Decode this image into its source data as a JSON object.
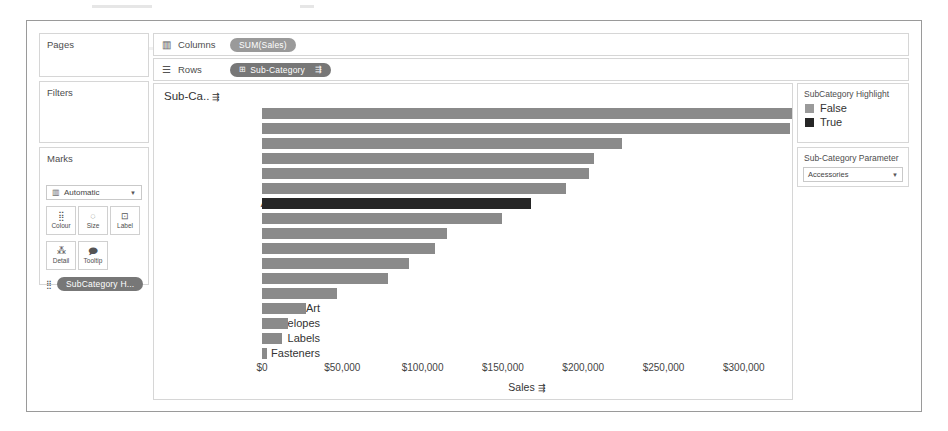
{
  "shelves": {
    "pages_label": "Pages",
    "filters_label": "Filters",
    "marks_label": "Marks",
    "columns_label": "Columns",
    "rows_label": "Rows",
    "columns_icon": "columns-icon",
    "rows_icon": "rows-icon",
    "columns_pill": "SUM(Sales)",
    "rows_pill": "Sub-Category",
    "rows_pill_icon": "discrete-field-icon",
    "rows_pill_sort": "sort-icon"
  },
  "marks": {
    "type_value": "Automatic",
    "type_icon": "bar-mark-icon",
    "buttons": [
      {
        "label": "Colour",
        "icon": "colour-icon"
      },
      {
        "label": "Size",
        "icon": "size-icon"
      },
      {
        "label": "Label",
        "icon": "label-icon"
      },
      {
        "label": "Detail",
        "icon": "detail-icon"
      },
      {
        "label": "Tooltip",
        "icon": "tooltip-icon"
      }
    ],
    "pill": "SubCategory H...",
    "pill_icon": "colour-icon"
  },
  "legend": {
    "title": "SubCategory Highlight",
    "items": [
      {
        "label": "False",
        "colour": "#9a9a9a"
      },
      {
        "label": "True",
        "colour": "#262626"
      }
    ]
  },
  "parameter": {
    "title": "Sub-Category Parameter",
    "value": "Accessories",
    "caret_icon": "chevron-down-icon"
  },
  "chart_data": {
    "type": "bar",
    "title": "",
    "orientation": "horizontal",
    "field_header": "Sub-Ca..",
    "field_header_sort_icon": "sort-icon",
    "xlabel": "Sales",
    "xlabel_sort_icon": "sort-icon",
    "ylabel": "",
    "xlim": [
      0,
      330000
    ],
    "ticks": [
      0,
      50000,
      100000,
      150000,
      200000,
      250000,
      300000
    ],
    "tick_labels": [
      "$0",
      "$50,000",
      "$100,000",
      "$150,000",
      "$200,000",
      "$250,000",
      "$300,000"
    ],
    "grid": false,
    "legend_position": "right",
    "highlight_category": "Accessories",
    "colours": {
      "normal": "#8a8a8a",
      "highlight": "#262626"
    },
    "categories": [
      "Phones",
      "Chairs",
      "Storage",
      "Tables",
      "Binders",
      "Machines",
      "Accessories",
      "Copiers",
      "Bookcases",
      "Appliances",
      "Furnishings",
      "Paper",
      "Supplies",
      "Art",
      "Envelopes",
      "Labels",
      "Fasteners"
    ],
    "values": [
      330007,
      328449,
      223844,
      206966,
      203413,
      189239,
      167380,
      149528,
      114880,
      107532,
      91705,
      78479,
      46674,
      27119,
      16476,
      12486,
      3024
    ]
  }
}
